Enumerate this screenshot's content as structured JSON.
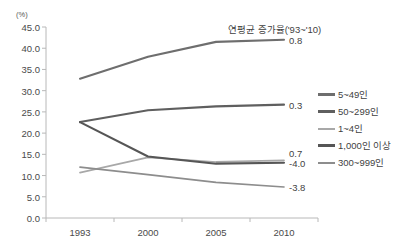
{
  "chart_data": {
    "type": "line",
    "title": "",
    "unit_label": "(%)",
    "xlabel": "",
    "ylabel": "",
    "categories": [
      "1993",
      "2000",
      "2005",
      "2010"
    ],
    "x_values": [
      1993,
      2000,
      2005,
      2010
    ],
    "ylim": [
      0.0,
      45.0
    ],
    "y_ticks": [
      "0.0",
      "5.0",
      "10.0",
      "15.0",
      "20.0",
      "25.0",
      "30.0",
      "35.0",
      "40.0",
      "45.0"
    ],
    "y_tick_values": [
      0.0,
      5.0,
      10.0,
      15.0,
      20.0,
      25.0,
      30.0,
      35.0,
      40.0,
      45.0
    ],
    "grid": false,
    "legend_position": "right",
    "annotation_header": "연평균 증가율('93~'10)",
    "series": [
      {
        "name": "5~49인",
        "values": [
          32.8,
          38.0,
          41.5,
          42.0
        ],
        "growth_label": "0.8",
        "color": "#6e6e6e"
      },
      {
        "name": "50~299인",
        "values": [
          22.6,
          25.4,
          26.3,
          26.7
        ],
        "growth_label": "0.3",
        "color": "#5f5f5f"
      },
      {
        "name": "1~4인",
        "values": [
          10.7,
          14.3,
          13.2,
          13.6
        ],
        "growth_label": "0.7",
        "color": "#a8a8a8"
      },
      {
        "name": "1,000인 이상",
        "values": [
          22.6,
          14.5,
          12.8,
          13.0
        ],
        "growth_label": "-4.0",
        "color": "#565656"
      },
      {
        "name": "300~999인",
        "values": [
          12.0,
          10.2,
          8.4,
          7.3
        ],
        "growth_label": "-3.8",
        "color": "#8d8d8d"
      }
    ]
  },
  "legend": {
    "items": [
      {
        "label": "5~49인",
        "color": "#6e6e6e"
      },
      {
        "label": "50~299인",
        "color": "#5f5f5f"
      },
      {
        "label": "1~4인",
        "color": "#a8a8a8"
      },
      {
        "label": "1,000인 이상",
        "color": "#565656"
      },
      {
        "label": "300~999인",
        "color": "#8d8d8d"
      }
    ]
  },
  "end_labels": [
    {
      "text": "0.8",
      "value": 42.0
    },
    {
      "text": "0.3",
      "value": 26.7
    },
    {
      "text": "0.7",
      "value": 15.2
    },
    {
      "text": "-4.0",
      "value": 13.0
    },
    {
      "text": "-3.8",
      "value": 7.3
    }
  ],
  "axis": {
    "unit": "(%)"
  }
}
